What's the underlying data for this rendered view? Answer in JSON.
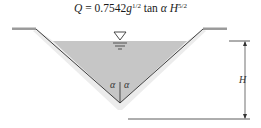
{
  "formula": {
    "lhs": "Q",
    "equals": "=",
    "coefficient": "0.7542",
    "g": "g",
    "g_exp": "1/2",
    "tan": "tan",
    "alpha": "α",
    "H": "H",
    "H_exp": "5/2"
  },
  "labels": {
    "height": "H",
    "angle_left": "α",
    "angle_right": "α"
  },
  "symbols": {
    "free_surface": "water-surface-triangle"
  },
  "colors": {
    "water": "#c8c8c8",
    "line": "#2a2a2a",
    "background": "#ffffff"
  }
}
